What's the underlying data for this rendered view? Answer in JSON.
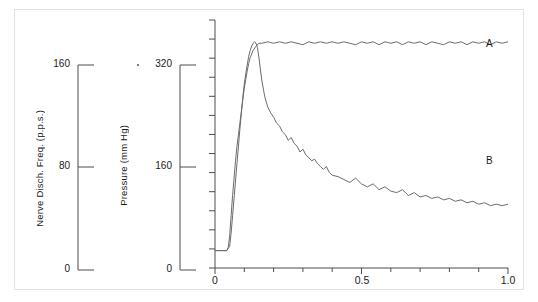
{
  "figure": {
    "background_color": "#ffffff",
    "frame_color": "#e2e2e2",
    "line_color": "#6b6b6b",
    "axis_color": "#4d4d4d",
    "text_color": "#1a1a1a"
  },
  "axes": {
    "left_axis": {
      "title": "Nerve Disch. Freq. (p.p.s.)",
      "ticks": [
        "0",
        "80",
        "160"
      ],
      "tick_values": [
        0,
        80,
        160
      ],
      "range": [
        0,
        160
      ]
    },
    "middle_axis": {
      "title": "Pressure (mm Hg)",
      "ticks": [
        "0",
        "160",
        "320"
      ],
      "tick_values": [
        0,
        160,
        320
      ],
      "range": [
        0,
        320
      ]
    },
    "x_axis": {
      "ticks": [
        "0",
        "0.5",
        "1.0"
      ],
      "tick_values": [
        0,
        0.5,
        1.0
      ],
      "range": [
        0,
        1.0
      ],
      "minor_tick_count": 10
    }
  },
  "annotations": {
    "curve_a_label": "A",
    "curve_b_label": "B"
  },
  "chart_data": {
    "type": "line",
    "title": "",
    "xlabel": "",
    "ylabel": "Nerve Disch. Freq. (p.p.s.) / Pressure (mm Hg)",
    "xlim": [
      0,
      1.0
    ],
    "ylim": [
      0,
      320
    ],
    "grid": false,
    "legend": "inline-end-labels",
    "xticks": [
      0,
      0.5,
      1.0
    ],
    "xticklabels": [
      "0",
      "0.5",
      "1.0"
    ],
    "series": [
      {
        "name": "A",
        "label": "A",
        "axis": "left",
        "description": "Rises from baseline and plateaus near maximum with small noise",
        "x": [
          0.0,
          0.02,
          0.04,
          0.045,
          0.05,
          0.055,
          0.06,
          0.065,
          0.07,
          0.075,
          0.08,
          0.085,
          0.09,
          0.095,
          0.1,
          0.105,
          0.11,
          0.115,
          0.12,
          0.13,
          0.14,
          0.15,
          0.16,
          0.18,
          0.2,
          0.22,
          0.24,
          0.26,
          0.28,
          0.3,
          0.32,
          0.34,
          0.36,
          0.38,
          0.4,
          0.42,
          0.44,
          0.46,
          0.48,
          0.5,
          0.52,
          0.54,
          0.56,
          0.58,
          0.6,
          0.62,
          0.64,
          0.66,
          0.68,
          0.7,
          0.72,
          0.74,
          0.76,
          0.78,
          0.8,
          0.82,
          0.84,
          0.86,
          0.88,
          0.9,
          0.92,
          0.94,
          0.96,
          0.98,
          1.0
        ],
        "y": [
          12,
          12,
          12,
          14,
          22,
          36,
          50,
          62,
          74,
          84,
          92,
          100,
          108,
          116,
          124,
          130,
          136,
          141,
          145,
          150,
          153,
          155,
          155,
          156,
          155,
          156,
          155,
          156,
          155,
          154,
          156,
          155,
          156,
          155,
          156,
          155,
          156,
          155,
          154,
          156,
          155,
          156,
          154,
          156,
          155,
          156,
          154,
          156,
          155,
          156,
          154,
          156,
          155,
          154,
          156,
          155,
          156,
          154,
          156,
          155,
          156,
          154,
          156,
          155,
          156
        ]
      },
      {
        "name": "B",
        "label": "B",
        "axis": "middle",
        "description": "Sharp overshoot peak then rapid decay with step-like noise to a slow decline",
        "x": [
          0.0,
          0.02,
          0.04,
          0.05,
          0.055,
          0.06,
          0.065,
          0.07,
          0.075,
          0.08,
          0.085,
          0.09,
          0.095,
          0.1,
          0.105,
          0.11,
          0.115,
          0.12,
          0.125,
          0.13,
          0.135,
          0.14,
          0.145,
          0.15,
          0.16,
          0.17,
          0.18,
          0.19,
          0.2,
          0.21,
          0.22,
          0.23,
          0.24,
          0.25,
          0.26,
          0.27,
          0.28,
          0.29,
          0.3,
          0.31,
          0.32,
          0.33,
          0.34,
          0.35,
          0.36,
          0.37,
          0.38,
          0.39,
          0.4,
          0.42,
          0.44,
          0.46,
          0.48,
          0.5,
          0.52,
          0.54,
          0.56,
          0.58,
          0.6,
          0.62,
          0.64,
          0.66,
          0.68,
          0.7,
          0.72,
          0.74,
          0.76,
          0.78,
          0.8,
          0.82,
          0.84,
          0.86,
          0.88,
          0.9,
          0.92,
          0.94,
          0.96,
          0.98,
          1.0
        ],
        "y": [
          24,
          24,
          24,
          30,
          48,
          72,
          96,
          120,
          144,
          168,
          192,
          214,
          236,
          254,
          268,
          280,
          292,
          300,
          306,
          310,
          312,
          310,
          304,
          290,
          258,
          236,
          222,
          214,
          208,
          200,
          196,
          188,
          184,
          176,
          180,
          172,
          168,
          160,
          164,
          156,
          152,
          148,
          150,
          144,
          140,
          136,
          140,
          132,
          128,
          126,
          122,
          118,
          124,
          116,
          112,
          116,
          108,
          112,
          106,
          104,
          108,
          100,
          104,
          98,
          100,
          96,
          98,
          94,
          96,
          92,
          94,
          90,
          92,
          88,
          90,
          86,
          88,
          86,
          88
        ]
      }
    ]
  }
}
